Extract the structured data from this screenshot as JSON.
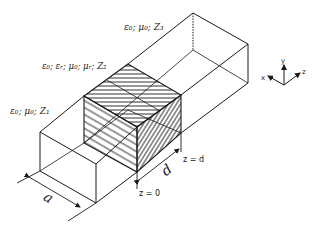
{
  "figure": {
    "labels": {
      "region1": "ε₀; μ₀; Z₁",
      "region2": "ε₀; εᵣ; μ₀; μᵣ; Z₂",
      "region3": "ε₀; μ₀; Z₃",
      "width": "a",
      "length": "d",
      "z0": "z = 0",
      "zd": "z = d"
    },
    "axes": {
      "x": "x",
      "y": "y",
      "z": "z"
    },
    "colors": {
      "line": "#1a1a1a",
      "text": "#222222",
      "background": "#ffffff"
    }
  }
}
